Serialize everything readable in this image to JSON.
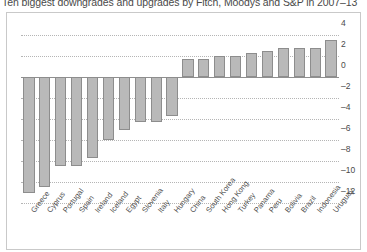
{
  "title": "Ten biggest downgrades and upgrades by Fitch, Moodys and S&P in 2007–13",
  "chart_data": {
    "type": "bar",
    "title": "Ten biggest downgrades and upgrades by Fitch, Moodys and S&P in 2007–13",
    "xlabel": "",
    "ylabel": "",
    "ylim": [
      -12,
      4
    ],
    "grid": true,
    "legend": false,
    "yticks": [
      "4",
      "2",
      "0",
      "–2",
      "–4",
      "–6",
      "–8",
      "–10",
      "–12"
    ],
    "ytick_values": [
      4,
      2,
      0,
      -2,
      -4,
      -6,
      -8,
      -10,
      -12
    ],
    "y_axis_position": "right",
    "bar_color": "#b9b9b9",
    "bar_border_color": "#8d8d8d",
    "categories": [
      "Greece",
      "Cyprus",
      "Portugal",
      "Spain",
      "Ireland",
      "Iceland",
      "Egypt",
      "Slovenia",
      "Italy",
      "Hungary",
      "China",
      "South Korea",
      "Hong Kong",
      "Turkey",
      "Panama",
      "Peru",
      "Bolivia",
      "Brazil",
      "Indonesia",
      "Uruguay"
    ],
    "values": [
      -11.0,
      -10.5,
      -8.5,
      -8.5,
      -7.7,
      -6.0,
      -5.0,
      -4.3,
      -4.3,
      -3.7,
      1.7,
      1.7,
      2.0,
      2.0,
      2.3,
      2.5,
      2.8,
      2.8,
      2.8,
      3.5
    ]
  }
}
